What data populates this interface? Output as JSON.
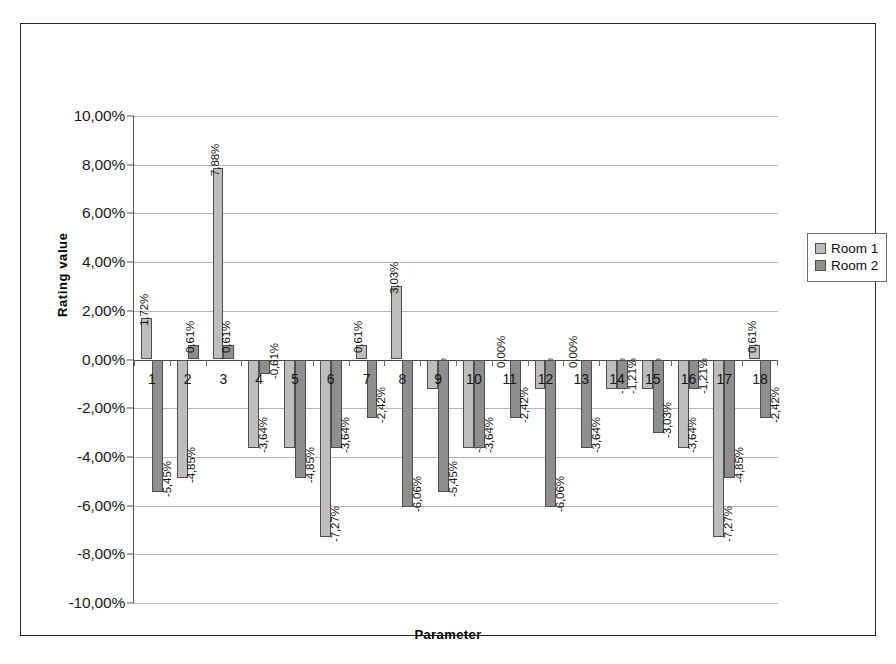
{
  "chart_data": {
    "type": "bar",
    "title": "",
    "xlabel": "Parameter",
    "ylabel": "Rating value",
    "ylim": [
      -10,
      10
    ],
    "ytick_labels": [
      "10,00%",
      "8,00%",
      "6,00%",
      "4,00%",
      "2,00%",
      "0,00%",
      "-2,00%",
      "-4,00%",
      "-6,00%",
      "-8,00%",
      "-10,00%"
    ],
    "ytick_values": [
      10,
      8,
      6,
      4,
      2,
      0,
      -2,
      -4,
      -6,
      -8,
      -10
    ],
    "grid": true,
    "legend_position": "right",
    "categories": [
      "1",
      "2",
      "3",
      "4",
      "5",
      "6",
      "7",
      "8",
      "9",
      "10",
      "11",
      "12",
      "13",
      "14",
      "15",
      "16",
      "17",
      "18"
    ],
    "series": [
      {
        "name": "Room 1",
        "color": "#bdbdbd",
        "values": [
          1.72,
          -4.85,
          7.88,
          -3.64,
          -3.64,
          -7.27,
          0.61,
          3.03,
          -1.21,
          -3.64,
          0.0,
          -1.21,
          0.0,
          -1.21,
          -1.21,
          -3.64,
          -7.27,
          0.61
        ],
        "labels": [
          "1,72%",
          "-4,85%",
          "7,88%",
          "-3,64%",
          "-3,64%",
          "-7,27%",
          "0,61%",
          "3,03%",
          "-1,21%",
          "-3,64%",
          "0,00%",
          "-1,21%",
          "0,00%",
          "-1,21%",
          "-1,21%",
          "-3,64%",
          "-7,27%",
          "0,61%"
        ]
      },
      {
        "name": "Room 2",
        "color": "#8e8e8e",
        "values": [
          -5.45,
          0.61,
          0.61,
          -0.61,
          -4.85,
          -3.64,
          -2.42,
          -6.06,
          -5.45,
          -3.64,
          -2.42,
          -6.06,
          -3.64,
          -1.21,
          -3.03,
          -1.21,
          -4.85,
          -2.42
        ],
        "labels": [
          "-5,45%",
          "0,61%",
          "0,61%",
          "-0,61%",
          "-4,85%",
          "-3,64%",
          "-2,42%",
          "-6,06%",
          "-5,45%",
          "-3,64%",
          "-2,42%",
          "-6,06%",
          "-3,64%",
          "-1,21%",
          "-3,03%",
          "-1,21%",
          "-4,85%",
          "-2,42%"
        ]
      }
    ]
  },
  "legend": {
    "items": [
      {
        "label": "Room 1"
      },
      {
        "label": "Room 2"
      }
    ]
  }
}
